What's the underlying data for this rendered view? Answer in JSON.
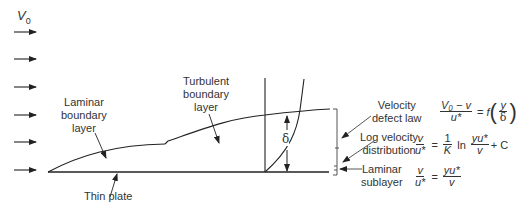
{
  "freestream": {
    "symbol": "V",
    "subscript": "0",
    "arrow_count": 6
  },
  "labels": {
    "laminar_bl": [
      "Laminar",
      "boundary",
      "layer"
    ],
    "turbulent_bl": [
      "Turbulent",
      "boundary",
      "layer"
    ],
    "thin_plate": "Thin plate",
    "delta": "δ"
  },
  "regions": {
    "velocity_defect": {
      "label": [
        "Velocity",
        "defect law"
      ],
      "eq": {
        "num": "V₀ − v",
        "den": "u*",
        "eq": "=",
        "f": "f",
        "inner_num": "y",
        "inner_den": "δ"
      }
    },
    "log_velocity": {
      "label": [
        "Log velocity",
        "distribution"
      ],
      "eq": {
        "num": "v",
        "den": "u*",
        "eq": "=",
        "k_num": "1",
        "k_den": "K",
        "ln": "ln",
        "yu_num": "yu*",
        "yu_den": "v",
        "plus_c": "+ C"
      }
    },
    "laminar_sublayer": {
      "label": [
        "Laminar",
        "sublayer"
      ],
      "eq": {
        "num": "v",
        "den": "u*",
        "eq": "=",
        "r_num": "yu*",
        "r_den": "v"
      }
    }
  }
}
